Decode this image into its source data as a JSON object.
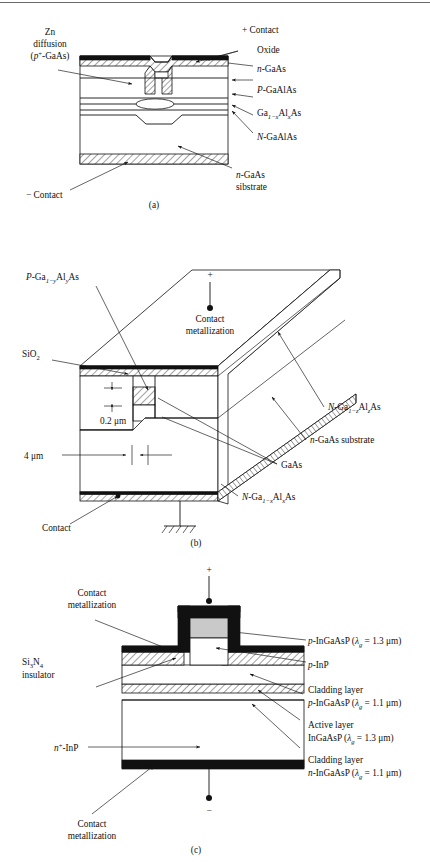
{
  "page": {
    "background": "#ffffff",
    "ink": "#111111",
    "grey_fill": "#c9c9c9"
  },
  "figures": [
    {
      "id": "a",
      "caption": "(a)",
      "type": "cross-section-diagram",
      "labels": {
        "zn_diffusion_l1": "Zn",
        "zn_diffusion_l2": "diffusion",
        "zn_diffusion_l3_pre": "(",
        "zn_diffusion_l3_p": "p",
        "zn_diffusion_l3_sup": "+",
        "zn_diffusion_l3_post": "-GaAs)",
        "plus_contact": "+ Contact",
        "oxide": "Oxide",
        "n_gaas_italic": "n",
        "n_gaas_rest": "-GaAs",
        "p_gaalas_italic": "P",
        "p_gaalas_rest": "-GaAlAs",
        "gaalas_base": "Ga",
        "gaalas_sub1": "1−x",
        "gaalas_mid": "Al",
        "gaalas_sub2": "x",
        "gaalas_end": "As",
        "N_gaalas_italic": "N",
        "N_gaalas_rest": "-GaAlAs",
        "minus_contact": "− Contact",
        "substrate_italic": "n",
        "substrate_rest": "-GaAs",
        "substrate_line2": "sibstrate"
      }
    },
    {
      "id": "b",
      "caption": "(b)",
      "type": "perspective-3d-diagram",
      "labels": {
        "p_gayalas_italic": "P",
        "p_gayalas_base": "-Ga",
        "p_gayalas_sub1": "1−y",
        "p_gayalas_mid": "Al",
        "p_gayalas_sub2": "y",
        "p_gayalas_end": "As",
        "sio2_base": "SiO",
        "sio2_sub": "2",
        "plus_sign": "+",
        "contact_metallization_l1": "Contact",
        "contact_metallization_l2": "metallization",
        "thickness_dim": "0.2 μm",
        "width_dim": "4 μm",
        "N_gazalas_italic": "N",
        "N_gazalas_base": "-Ga",
        "N_gazalas_sub1": "1−z",
        "N_gazalas_mid": "Al",
        "N_gazalas_sub2": "z",
        "N_gazalas_end": "As",
        "n_gaas_substrate_italic": "n",
        "n_gaas_substrate_rest": "-GaAs substrate",
        "gaas": "GaAs",
        "N_gaxalas_italic": "N",
        "N_gaxalas_base": "-Ga",
        "N_gaxalas_sub1": "1−x",
        "N_gaxalas_mid": "Al",
        "N_gaxalas_sub2": "x",
        "N_gaxalas_end": "As",
        "contact": "Contact"
      }
    },
    {
      "id": "c",
      "caption": "(c)",
      "type": "cross-section-diagram",
      "labels": {
        "contact_metallization_top_l1": "Contact",
        "contact_metallization_top_l2": "metallization",
        "si3n4_base1": "Si",
        "si3n4_sub1": "3",
        "si3n4_base2": "N",
        "si3n4_sub2": "4",
        "si3n4_line2": "insulator",
        "terminal_plus": "+",
        "terminal_minus": "−",
        "n_plus_inp_italic": "n",
        "n_plus_inp_sup": "+",
        "n_plus_inp_rest": "-InP",
        "contact_metallization_bottom_l1": "Contact",
        "contact_metallization_bottom_l2": "metallization",
        "right_labels": [
          {
            "italic": "p",
            "text": "-InGaAsP (",
            "lambda": "λ",
            "lambda_sub": "g",
            "tail": " = 1.3 μm)"
          },
          {
            "italic": "p",
            "text": "-InP",
            "lambda": "",
            "lambda_sub": "",
            "tail": ""
          },
          {
            "line1": "Cladding layer",
            "italic": "p",
            "text": "-InGaAsP (",
            "lambda": "λ",
            "lambda_sub": "g",
            "tail": " = 1.1 μm)"
          },
          {
            "line1": "Active layer",
            "italic": "",
            "text": "InGaAsP (",
            "lambda": "λ",
            "lambda_sub": "g",
            "tail": " = 1.3 μm)"
          },
          {
            "line1": "Cladding layer",
            "italic": "n",
            "text": "-InGaAsP (",
            "lambda": "λ",
            "lambda_sub": "g",
            "tail": " = 1.1 μm)"
          }
        ]
      }
    }
  ]
}
